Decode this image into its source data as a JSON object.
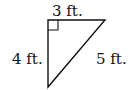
{
  "diagram": {
    "type": "right-triangle",
    "right_angle_vertex": "top-left",
    "sides": {
      "top": {
        "label": "3 ft.",
        "length": 3
      },
      "left": {
        "label": "4 ft.",
        "length": 4
      },
      "hypotenuse": {
        "label": "5 ft.",
        "length": 5
      }
    },
    "stroke_color": "#111111"
  }
}
